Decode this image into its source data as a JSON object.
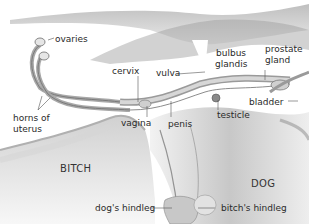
{
  "diagram": {
    "subjects": {
      "female": "BITCH",
      "male": "DOG"
    },
    "labels": {
      "ovaries": "ovaries",
      "cervix": "cervix",
      "vulva": "vulva",
      "bulbus_glandis_line1": "bulbus",
      "bulbus_glandis_line2": "glandis",
      "prostate_line1": "prostate",
      "prostate_line2": "gland",
      "horns_line1": "horns of",
      "horns_line2": "uterus",
      "vagina": "vagina",
      "penis": "penis",
      "testicle": "testicle",
      "bladder": "bladder",
      "dogs_hindleg": "dog's hindleg",
      "bitchs_hindleg": "bitch's hindleg"
    }
  }
}
